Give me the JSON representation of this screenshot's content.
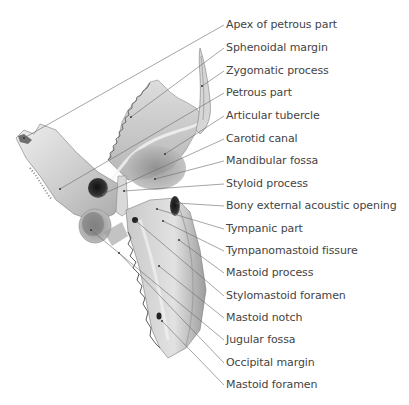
{
  "figure": {
    "colors": {
      "bone_light": "#e8e8e8",
      "bone_mid": "#bdbdbd",
      "bone_dark": "#555555",
      "leader": "#6a6a6a",
      "label_text": "#444444"
    }
  },
  "labels": [
    {
      "text": "Apex of petrous part",
      "y": 25,
      "target": [
        24,
        138
      ]
    },
    {
      "text": "Sphenoidal margin",
      "y": 48,
      "target": [
        131,
        117
      ]
    },
    {
      "text": "Zygomatic process",
      "y": 71,
      "target": [
        202,
        86
      ]
    },
    {
      "text": "Petrous part",
      "y": 93,
      "target": [
        60,
        189
      ]
    },
    {
      "text": "Articular tubercle",
      "y": 116,
      "target": [
        165,
        154
      ]
    },
    {
      "text": "Carotid canal",
      "y": 139,
      "target": [
        101,
        195
      ]
    },
    {
      "text": "Mandibular fossa",
      "y": 161,
      "target": [
        155,
        179
      ]
    },
    {
      "text": "Styloid process",
      "y": 184,
      "target": [
        124,
        191
      ]
    },
    {
      "text": "Bony external acoustic opening",
      "y": 206,
      "target": [
        176,
        203
      ]
    },
    {
      "text": "Tympanic part",
      "y": 229,
      "target": [
        157,
        209
      ]
    },
    {
      "text": "Tympanomastoid fissure",
      "y": 251,
      "target": [
        163,
        221
      ]
    },
    {
      "text": "Mastoid process",
      "y": 273,
      "target": [
        179,
        240
      ]
    },
    {
      "text": "Stylomastoid foramen",
      "y": 296,
      "target": [
        136,
        221
      ]
    },
    {
      "text": "Mastoid notch",
      "y": 318,
      "target": [
        159,
        266
      ]
    },
    {
      "text": "Jugular fossa",
      "y": 340,
      "target": [
        91,
        230
      ]
    },
    {
      "text": "Occipital margin",
      "y": 363,
      "target": [
        119,
        253
      ]
    },
    {
      "text": "Mastoid foramen",
      "y": 385,
      "target": [
        162,
        321
      ]
    }
  ]
}
